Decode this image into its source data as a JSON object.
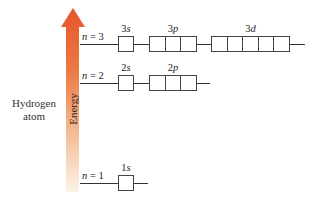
{
  "atom": {
    "line1": "Hydrogen",
    "line2": "atom"
  },
  "axis": {
    "label": "Energy",
    "colors": {
      "top": "#E8552A",
      "mid": "#EE8A55",
      "bottom": "#FBF1E2"
    }
  },
  "levels": [
    {
      "n_label": "n = 3",
      "n_var": "n",
      "n_value": "3",
      "orbitals": [
        {
          "label": "3s",
          "num": "3",
          "letter": "s",
          "cells": 1
        },
        {
          "label": "3p",
          "num": "3",
          "letter": "p",
          "cells": 3
        },
        {
          "label": "3d",
          "num": "3",
          "letter": "d",
          "cells": 5
        }
      ]
    },
    {
      "n_label": "n = 2",
      "n_var": "n",
      "n_value": "2",
      "orbitals": [
        {
          "label": "2s",
          "num": "2",
          "letter": "s",
          "cells": 1
        },
        {
          "label": "2p",
          "num": "2",
          "letter": "p",
          "cells": 3
        }
      ]
    },
    {
      "n_label": "n = 1",
      "n_var": "n",
      "n_value": "1",
      "orbitals": [
        {
          "label": "1s",
          "num": "1",
          "letter": "s",
          "cells": 1
        }
      ]
    }
  ]
}
